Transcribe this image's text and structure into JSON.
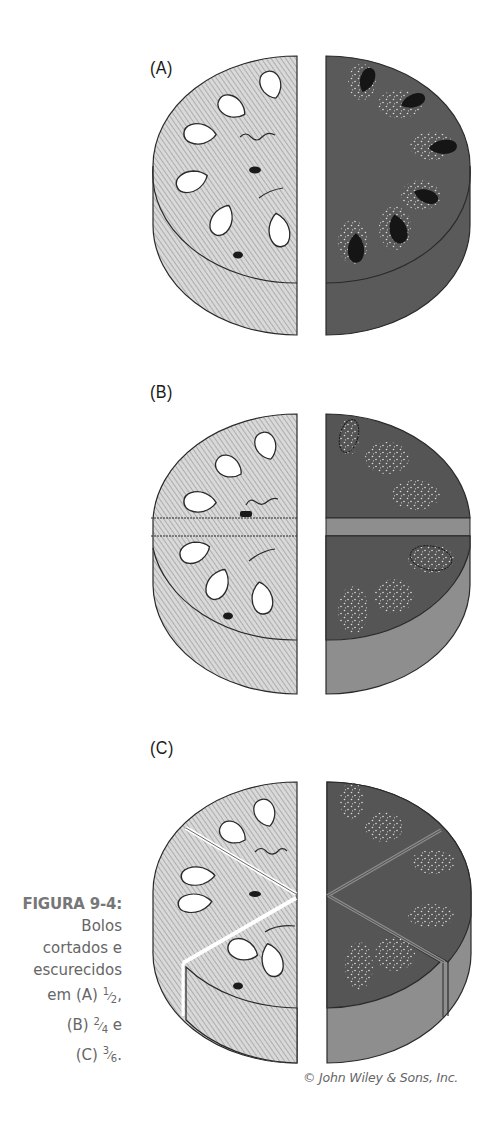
{
  "figure": {
    "panels": [
      {
        "label": "(A)",
        "fraction": "1/2",
        "pieces_per_half": 1
      },
      {
        "label": "(B)",
        "fraction": "2/4",
        "pieces_per_half": 2
      },
      {
        "label": "(C)",
        "fraction": "3/6",
        "pieces_per_half": 3
      }
    ],
    "colors": {
      "light_top": "#d4d4d4",
      "light_hatch": "#a8a8a8",
      "dark_top": "#555555",
      "dark_side": "#8e8e8e",
      "outline": "#2a2a2a",
      "hole": "#ffffff",
      "dark_seed": "#1a1a1a",
      "speckle": "#d8d8d8"
    }
  },
  "caption": {
    "title": "FIGURA 9-4:",
    "line1": "Bolos",
    "line2": "cortados e",
    "line3": "escurecidos",
    "line4_prefix": "em (A) ",
    "line4_num": "1",
    "line4_den": "2",
    "line4_suffix": ",",
    "line5_prefix": "(B) ",
    "line5_num": "2",
    "line5_den": "4",
    "line5_suffix": " e",
    "line6_prefix": "(C) ",
    "line6_num": "3",
    "line6_den": "6",
    "line6_suffix": "."
  },
  "credit": "© John Wiley & Sons, Inc."
}
